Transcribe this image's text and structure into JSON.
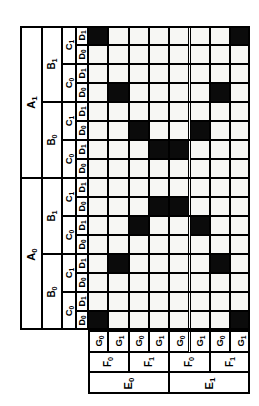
{
  "diagram": {
    "type": "karnaugh-map",
    "orientation": "rotated-90",
    "grid": {
      "rows": 16,
      "cols": 8
    },
    "row_variables": [
      "A",
      "B",
      "C",
      "D"
    ],
    "col_variables": [
      "E",
      "F",
      "G"
    ],
    "row_headers": {
      "level_a": [
        {
          "label": "A",
          "sub": "1",
          "span": 8
        },
        {
          "label": "A",
          "sub": "0",
          "span": 8
        }
      ],
      "level_b": [
        {
          "label": "B",
          "sub": "1",
          "span": 4
        },
        {
          "label": "B",
          "sub": "0",
          "span": 4
        },
        {
          "label": "B",
          "sub": "1",
          "span": 4
        },
        {
          "label": "B",
          "sub": "0",
          "span": 4
        }
      ],
      "level_c": [
        {
          "label": "C",
          "sub": "1",
          "span": 2
        },
        {
          "label": "C",
          "sub": "0",
          "span": 2
        },
        {
          "label": "C",
          "sub": "1",
          "span": 2
        },
        {
          "label": "C",
          "sub": "0",
          "span": 2
        },
        {
          "label": "C",
          "sub": "1",
          "span": 2
        },
        {
          "label": "C",
          "sub": "0",
          "span": 2
        },
        {
          "label": "C",
          "sub": "1",
          "span": 2
        },
        {
          "label": "C",
          "sub": "0",
          "span": 2
        }
      ],
      "level_d": [
        {
          "label": "D",
          "sub": "1"
        },
        {
          "label": "D",
          "sub": "0"
        },
        {
          "label": "D",
          "sub": "1"
        },
        {
          "label": "D",
          "sub": "0"
        },
        {
          "label": "D",
          "sub": "1"
        },
        {
          "label": "D",
          "sub": "0"
        },
        {
          "label": "D",
          "sub": "1"
        },
        {
          "label": "D",
          "sub": "0"
        },
        {
          "label": "D",
          "sub": "1"
        },
        {
          "label": "D",
          "sub": "0"
        },
        {
          "label": "D",
          "sub": "1"
        },
        {
          "label": "D",
          "sub": "0"
        },
        {
          "label": "D",
          "sub": "1"
        },
        {
          "label": "D",
          "sub": "0"
        },
        {
          "label": "D",
          "sub": "1"
        },
        {
          "label": "D",
          "sub": "0"
        }
      ]
    },
    "col_headers": {
      "level_g": [
        {
          "label": "G",
          "sub": "0"
        },
        {
          "label": "G",
          "sub": "1"
        },
        {
          "label": "G",
          "sub": "0"
        },
        {
          "label": "G",
          "sub": "1"
        },
        {
          "label": "G",
          "sub": "0"
        },
        {
          "label": "G",
          "sub": "1"
        },
        {
          "label": "G",
          "sub": "0"
        },
        {
          "label": "G",
          "sub": "1"
        }
      ],
      "level_f": [
        {
          "label": "F",
          "sub": "0",
          "span": 2
        },
        {
          "label": "F",
          "sub": "1",
          "span": 2
        },
        {
          "label": "F",
          "sub": "0",
          "span": 2
        },
        {
          "label": "F",
          "sub": "1",
          "span": 2
        }
      ],
      "level_e": [
        {
          "label": "E",
          "sub": "0",
          "span": 4
        },
        {
          "label": "E",
          "sub": "1",
          "span": 4
        }
      ]
    },
    "filled_cells": [
      {
        "row": 1,
        "cols": [
          1,
          8
        ]
      },
      {
        "row": 4,
        "cols": [
          2,
          7
        ]
      },
      {
        "row": 6,
        "cols": [
          3,
          6
        ]
      },
      {
        "row": 7,
        "cols": [
          4,
          5
        ]
      },
      {
        "row": 10,
        "cols": [
          4,
          5
        ]
      },
      {
        "row": 11,
        "cols": [
          3,
          6
        ]
      },
      {
        "row": 13,
        "cols": [
          2,
          7
        ]
      },
      {
        "row": 16,
        "cols": [
          1,
          8
        ]
      }
    ],
    "colors": {
      "filled": "#0b0b0b",
      "empty": "#f7f7f4",
      "line": "#000000",
      "background": "#ffffff"
    }
  }
}
